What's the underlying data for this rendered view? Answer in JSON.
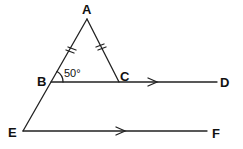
{
  "diagram": {
    "points": {
      "A": {
        "label": "A",
        "x": 87,
        "y": 19
      },
      "B": {
        "label": "B",
        "x": 51,
        "y": 82
      },
      "C": {
        "label": "C",
        "x": 119,
        "y": 82
      },
      "D": {
        "label": "D",
        "x": 217,
        "y": 82
      },
      "E": {
        "label": "E",
        "x": 23,
        "y": 131
      },
      "F": {
        "label": "F",
        "x": 207,
        "y": 131
      }
    },
    "angle_ABC": "50°",
    "segments": [
      "AB",
      "AC",
      "BD",
      "AE",
      "EF"
    ],
    "equal_marks": [
      "AB",
      "AC"
    ],
    "parallel": [
      "BD",
      "EF"
    ],
    "stroke_color": "#222222"
  }
}
